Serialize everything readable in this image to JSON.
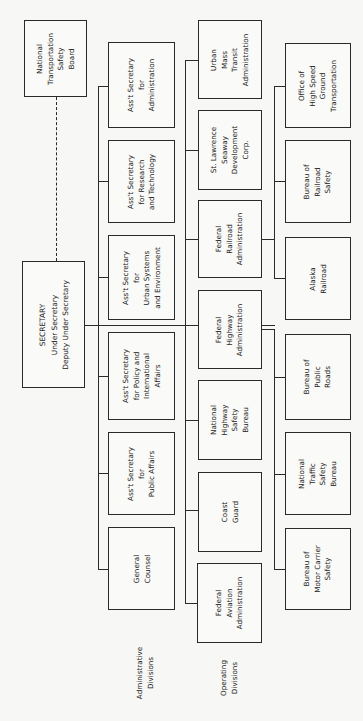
{
  "chart": {
    "type": "org-chart",
    "orientation": "rotated-90-ccw"
  },
  "top": {
    "secretary": [
      "SECRETARY",
      "Under Secretary",
      "Deputy Under Secretary"
    ],
    "ntsb": [
      "National",
      "Transportation",
      "Safety",
      "Board"
    ]
  },
  "administrative": {
    "label": [
      "Administrative",
      "Divisions"
    ],
    "boxes": [
      [
        "Ass't Secretary",
        "for",
        "Administration"
      ],
      [
        "Ass't Secretary",
        "for Research",
        "and Technology"
      ],
      [
        "Ass't Secretary",
        "for",
        "Urban Systems",
        "and Environment"
      ],
      [
        "Ass't Secretary",
        "for Policy and",
        "International",
        "Affairs"
      ],
      [
        "Ass't Secretary",
        "for",
        "Public Affairs"
      ],
      [
        "General",
        "Counsel"
      ]
    ]
  },
  "operating": {
    "label": [
      "Operating",
      "Divisions"
    ],
    "boxes": [
      [
        "Urban",
        "Mass",
        "Transit",
        "Administration"
      ],
      [
        "St. Lawrence",
        "Seaway",
        "Development",
        "Corp."
      ],
      [
        "Federal",
        "Railroad",
        "Administration"
      ],
      [
        "Federal",
        "Highway",
        "Administration"
      ],
      [
        "National",
        "Highway",
        "Safety",
        "Bureau"
      ],
      [
        "Coast",
        "Guard"
      ],
      [
        "Federal",
        "Aviation",
        "Administration"
      ]
    ]
  },
  "sub_bureaus": {
    "boxes": [
      [
        "Office of",
        "High Speed",
        "Ground",
        "Transportation"
      ],
      [
        "Bureau of",
        "Railroad",
        "Safety"
      ],
      [
        "Alaska",
        "Railroad"
      ],
      [
        "Bureau of",
        "Public",
        "Roads"
      ],
      [
        "National",
        "Traffic",
        "Safety",
        "Bureau"
      ],
      [
        "Bureau of",
        "Motor Carrier",
        "Safety"
      ]
    ]
  }
}
